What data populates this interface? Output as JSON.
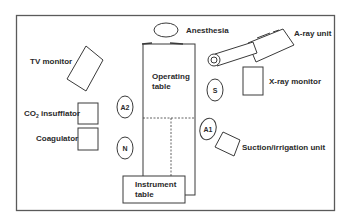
{
  "diagram": {
    "labels": {
      "anesthesia": "Anesthesia",
      "a_ray_unit": "A-ray unit",
      "tv_monitor": "TV monitor",
      "operating_table_line1": "Operating",
      "operating_table_line2": "table",
      "x_ray_monitor": "X-ray monitor",
      "co2_prefix": "CO",
      "co2_sub": "2",
      "co2_suffix": " insufflator",
      "coagulator": "Coagulator",
      "suction_irrigation": "Suction/irrigation unit",
      "instrument_table_line1": "Instrument",
      "instrument_table_line2": "table"
    },
    "personnel": {
      "a2": "A2",
      "n": "N",
      "s": "S",
      "a1": "A1"
    },
    "colors": {
      "stroke": "#3a3a3a",
      "border": "#5a5a5a",
      "text": "#2a2a2a",
      "background": "#ffffff"
    }
  }
}
